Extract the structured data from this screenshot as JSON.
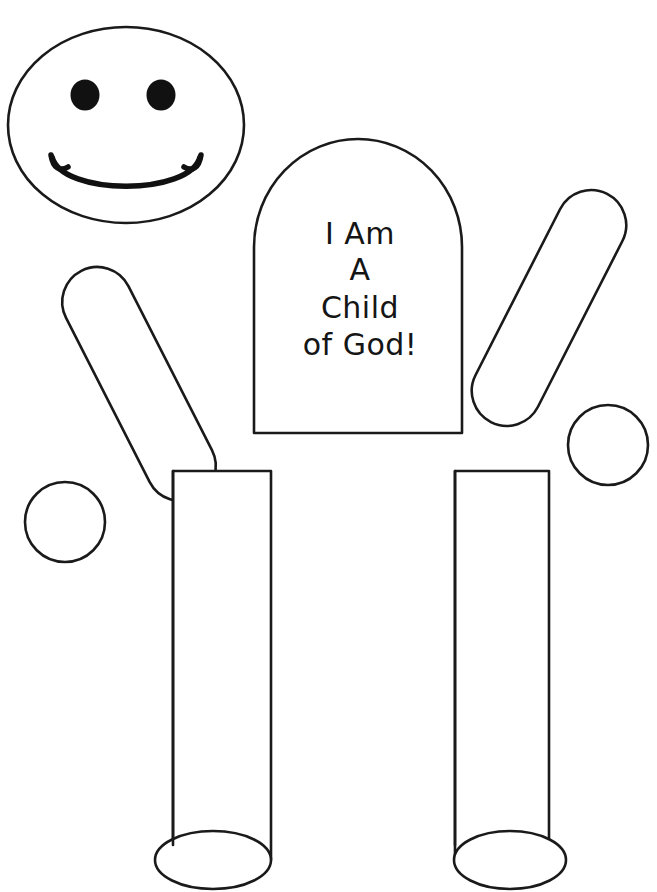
{
  "page": {
    "background_color": "#ffffff",
    "ink_color": "#1a1a1a",
    "fill_color": "#111111",
    "width": 657,
    "height": 892,
    "cutoff_header_text": ""
  },
  "figure": {
    "head": {
      "label": "smiley-face-head",
      "eye_left_label": "left-eye",
      "eye_right_label": "right-eye",
      "mouth_label": "smile-mouth"
    },
    "torso": {
      "label": "torso-body-piece",
      "lines": [
        "I Am",
        "A",
        "Child",
        "of God!"
      ]
    },
    "arms": [
      {
        "label": "left-arm",
        "hand_label": "left-hand"
      },
      {
        "label": "right-arm",
        "hand_label": "right-hand"
      }
    ],
    "legs": [
      {
        "label": "left-leg",
        "foot_label": "left-foot"
      },
      {
        "label": "right-leg",
        "foot_label": "right-foot"
      }
    ]
  }
}
